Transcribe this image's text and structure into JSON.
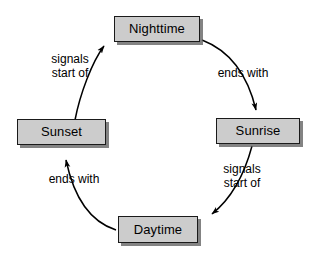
{
  "diagram": {
    "type": "cycle-diagram",
    "background_color": "#ffffff",
    "node_fill_color": "#cccccc",
    "node_border_color": "#1a1a1a",
    "node_shadow_color": "#5a5a5a",
    "text_color": "#000000",
    "arrow_color": "#000000",
    "nodes": [
      {
        "id": "nighttime",
        "label": "Nighttime"
      },
      {
        "id": "sunrise",
        "label": "Sunrise"
      },
      {
        "id": "daytime",
        "label": "Daytime"
      },
      {
        "id": "sunset",
        "label": "Sunset"
      }
    ],
    "edges": [
      {
        "id": "nighttime-sunrise",
        "from": "Nighttime",
        "to": "Sunrise",
        "label": "ends with",
        "label_lines": [
          "ends with"
        ]
      },
      {
        "id": "sunrise-daytime",
        "from": "Sunrise",
        "to": "Daytime",
        "label": "signals start of",
        "label_lines": [
          "signals",
          "start of"
        ]
      },
      {
        "id": "daytime-sunset",
        "from": "Daytime",
        "to": "Sunset",
        "label": "ends with",
        "label_lines": [
          "ends with"
        ]
      },
      {
        "id": "sunset-nighttime",
        "from": "Sunset",
        "to": "Nighttime",
        "label": "signals start of",
        "label_lines": [
          "signals",
          "start of"
        ]
      }
    ]
  }
}
